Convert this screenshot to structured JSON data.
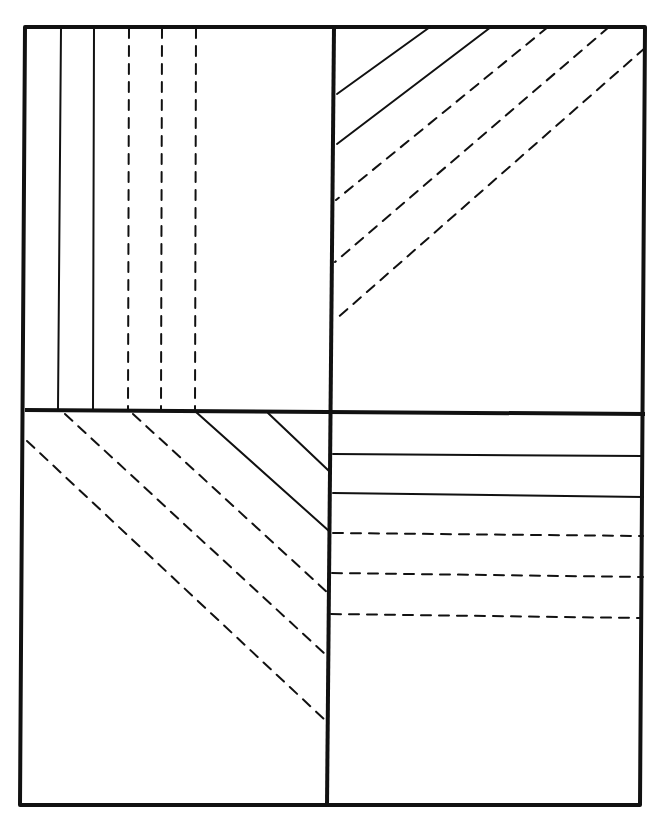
{
  "diagram": {
    "stroke_color": "#111111",
    "background": "#ffffff",
    "frame": {
      "outer": [
        [
          25,
          27
        ],
        [
          645,
          27
        ],
        [
          640,
          805
        ],
        [
          20,
          805
        ]
      ],
      "vertical_divider": [
        [
          334,
          27
        ],
        [
          327,
          805
        ]
      ],
      "horizontal_divider": [
        [
          25,
          410
        ],
        [
          645,
          414
        ]
      ]
    },
    "quadrants": [
      {
        "name": "top-left",
        "orientation": "vertical",
        "lines": [
          {
            "style": "solid",
            "x1": 61,
            "y1": 28,
            "x2": 58,
            "y2": 409
          },
          {
            "style": "solid",
            "x1": 94,
            "y1": 28,
            "x2": 93,
            "y2": 409
          },
          {
            "style": "dashed",
            "x1": 129,
            "y1": 28,
            "x2": 128,
            "y2": 409
          },
          {
            "style": "dashed",
            "x1": 162,
            "y1": 28,
            "x2": 161,
            "y2": 409
          },
          {
            "style": "dashed",
            "x1": 196,
            "y1": 28,
            "x2": 195,
            "y2": 409
          }
        ]
      },
      {
        "name": "top-right",
        "orientation": "diagonal-ascending",
        "lines": [
          {
            "style": "solid",
            "x1": 430,
            "y1": 27,
            "x2": 337,
            "y2": 94
          },
          {
            "style": "solid",
            "x1": 491,
            "y1": 27,
            "x2": 337,
            "y2": 144
          },
          {
            "style": "dashed",
            "x1": 548,
            "y1": 27,
            "x2": 336,
            "y2": 200
          },
          {
            "style": "dashed",
            "x1": 609,
            "y1": 27,
            "x2": 335,
            "y2": 262
          },
          {
            "style": "dashed",
            "x1": 645,
            "y1": 48,
            "x2": 335,
            "y2": 320
          }
        ]
      },
      {
        "name": "bottom-left",
        "orientation": "diagonal-descending",
        "lines": [
          {
            "style": "solid",
            "x1": 268,
            "y1": 413,
            "x2": 329,
            "y2": 471
          },
          {
            "style": "solid",
            "x1": 196,
            "y1": 412,
            "x2": 329,
            "y2": 531
          },
          {
            "style": "dashed",
            "x1": 133,
            "y1": 414,
            "x2": 328,
            "y2": 593
          },
          {
            "style": "dashed",
            "x1": 65,
            "y1": 414,
            "x2": 326,
            "y2": 655
          },
          {
            "style": "dashed",
            "x1": 27,
            "y1": 441,
            "x2": 325,
            "y2": 720
          }
        ]
      },
      {
        "name": "bottom-right",
        "orientation": "horizontal",
        "lines": [
          {
            "style": "solid",
            "x1": 333,
            "y1": 454,
            "x2": 643,
            "y2": 456
          },
          {
            "style": "solid",
            "x1": 333,
            "y1": 493,
            "x2": 643,
            "y2": 497
          },
          {
            "style": "dashed",
            "x1": 333,
            "y1": 533,
            "x2": 643,
            "y2": 536
          },
          {
            "style": "dashed",
            "x1": 332,
            "y1": 573,
            "x2": 643,
            "y2": 577
          },
          {
            "style": "dashed",
            "x1": 331,
            "y1": 614,
            "x2": 641,
            "y2": 618
          }
        ]
      }
    ]
  }
}
